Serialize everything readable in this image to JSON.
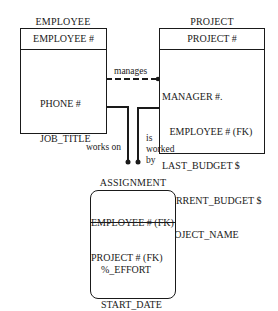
{
  "entities": {
    "employee": {
      "name": "EMPLOYEE",
      "key": "EMPLOYEE #",
      "attributes": [
        "PHONE #",
        "JOB_TITLE"
      ]
    },
    "project": {
      "name": "PROJECT",
      "key": "PROJECT #",
      "attributes": [
        "MANAGER #.",
        "   EMPLOYEE # (FK)",
        "LAST_BUDGET $",
        "CURRENT_BUDGET $",
        "PROJECT_NAME"
      ]
    },
    "assignment": {
      "name": "ASSIGNMENT",
      "keys": [
        "EMPLOYEE # (FK)",
        "PROJECT # (FK)"
      ],
      "attributes": [
        "%_EFFORT",
        "START_DATE"
      ]
    }
  },
  "relationships": {
    "manages": "manages",
    "works_on": "works on",
    "is_worked_by": [
      "is",
      "worked",
      "by"
    ]
  },
  "colors": {
    "line": "#1a1a1a",
    "background": "#ffffff"
  }
}
